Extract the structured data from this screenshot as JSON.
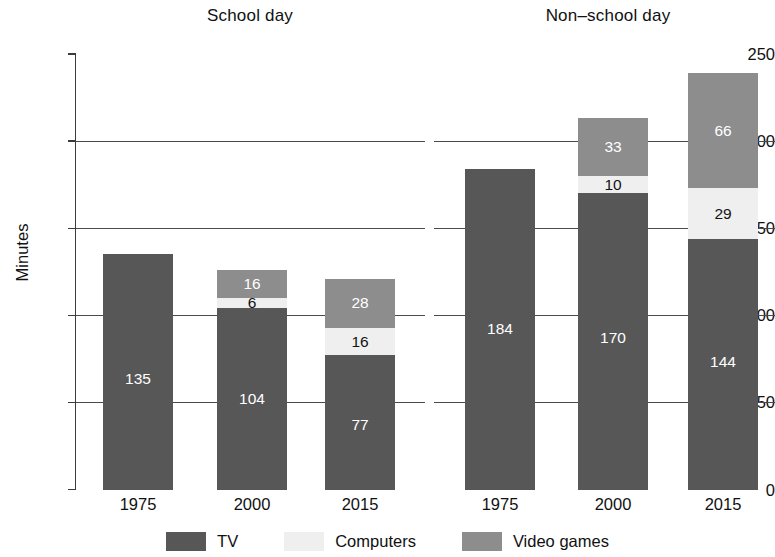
{
  "chart_data": {
    "type": "bar",
    "subtype": "stacked-bar",
    "title": "",
    "panels": [
      {
        "name": "school-day",
        "title": "School day",
        "categories": [
          "1975",
          "2000",
          "2015"
        ],
        "stacks": [
          {
            "category": "1975",
            "TV": 135,
            "Computers": 0,
            "Video games": 0,
            "total": 135
          },
          {
            "category": "2000",
            "TV": 104,
            "Computers": 6,
            "Video games": 16,
            "total": 126
          },
          {
            "category": "2015",
            "TV": 77,
            "Computers": 16,
            "Video games": 28,
            "total": 121
          }
        ]
      },
      {
        "name": "non-school-day",
        "title": "Non–school day",
        "categories": [
          "1975",
          "2000",
          "2015"
        ],
        "stacks": [
          {
            "category": "1975",
            "TV": 184,
            "Computers": 0,
            "Video games": 0,
            "total": 184
          },
          {
            "category": "2000",
            "TV": 170,
            "Computers": 10,
            "Video games": 33,
            "total": 213
          },
          {
            "category": "2015",
            "TV": 144,
            "Computers": 29,
            "Video games": 66,
            "total": 239
          }
        ]
      }
    ],
    "series": [
      {
        "name": "TV",
        "color": "#575757"
      },
      {
        "name": "Computers",
        "color": "#efefef"
      },
      {
        "name": "Video games",
        "color": "#8d8d8d"
      }
    ],
    "xlabel": "",
    "ylabel": "Minutes",
    "ylim": [
      0,
      250
    ],
    "yticks": [
      0,
      50,
      100,
      150,
      200,
      250
    ],
    "ytick_labels": [
      "0",
      "50",
      "100",
      "150",
      "200",
      "250"
    ],
    "grid": "horizontal",
    "legend_position": "bottom"
  },
  "axis": {
    "y_title": "Minutes",
    "y_ticks": [
      "250",
      "200",
      "150",
      "100",
      "50",
      "0"
    ]
  },
  "panels": {
    "school": {
      "title": "School day",
      "x_labels": [
        "1975",
        "2000",
        "2015"
      ],
      "bars": [
        {
          "year": "1975",
          "segments": [
            {
              "series": "TV",
              "value": 135,
              "label": "135"
            }
          ]
        },
        {
          "year": "2000",
          "segments": [
            {
              "series": "TV",
              "value": 104,
              "label": "104"
            },
            {
              "series": "Computers",
              "value": 6,
              "label": "6"
            },
            {
              "series": "Video games",
              "value": 16,
              "label": "16"
            }
          ]
        },
        {
          "year": "2015",
          "segments": [
            {
              "series": "TV",
              "value": 77,
              "label": "77"
            },
            {
              "series": "Computers",
              "value": 16,
              "label": "16"
            },
            {
              "series": "Video games",
              "value": 28,
              "label": "28"
            }
          ]
        }
      ]
    },
    "nonschool": {
      "title": "Non–school day",
      "x_labels": [
        "1975",
        "2000",
        "2015"
      ],
      "bars": [
        {
          "year": "1975",
          "segments": [
            {
              "series": "TV",
              "value": 184,
              "label": "184"
            }
          ]
        },
        {
          "year": "2000",
          "segments": [
            {
              "series": "TV",
              "value": 170,
              "label": "170"
            },
            {
              "series": "Computers",
              "value": 10,
              "label": "10"
            },
            {
              "series": "Video games",
              "value": 33,
              "label": "33"
            }
          ]
        },
        {
          "year": "2015",
          "segments": [
            {
              "series": "TV",
              "value": 144,
              "label": "144"
            },
            {
              "series": "Computers",
              "value": 29,
              "label": "29"
            },
            {
              "series": "Video games",
              "value": 66,
              "label": "66"
            }
          ]
        }
      ]
    }
  },
  "legend": {
    "items": [
      {
        "label": "TV",
        "color": "#575757",
        "series": "TV"
      },
      {
        "label": "Computers",
        "color": "#efefef",
        "series": "Computers"
      },
      {
        "label": "Video games",
        "color": "#8d8d8d",
        "series": "Video games"
      }
    ]
  }
}
